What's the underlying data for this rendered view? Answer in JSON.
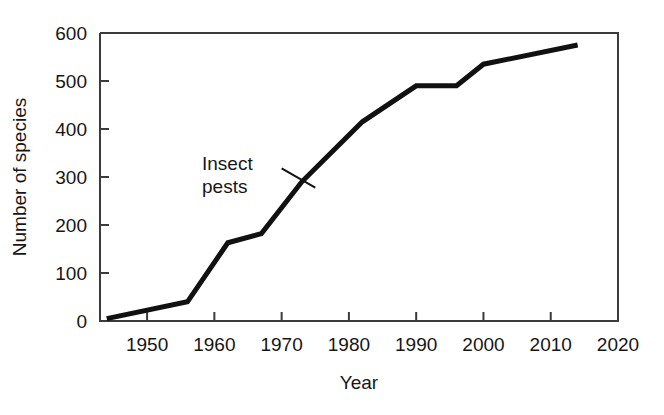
{
  "chart_data": {
    "type": "line",
    "title": "",
    "xlabel": "Year",
    "ylabel": "Number of species",
    "xlim": [
      1943,
      2020
    ],
    "ylim": [
      0,
      600
    ],
    "grid": false,
    "legend": "none",
    "xticks": [
      1950,
      1960,
      1970,
      1980,
      1990,
      2000,
      2010,
      2020
    ],
    "xtick_labels": [
      "1950",
      "1960",
      "1970",
      "1980",
      "1990",
      "2000",
      "2010",
      "2020"
    ],
    "yticks": [
      0,
      100,
      200,
      300,
      400,
      500,
      600
    ],
    "ytick_labels": [
      "0",
      "100",
      "200",
      "300",
      "400",
      "500",
      "600"
    ],
    "series": [
      {
        "name": "Insect pests",
        "color": "#111111",
        "x": [
          1944,
          1956,
          1962,
          1967,
          1973,
          1982,
          1990,
          1996,
          2000,
          2014
        ],
        "values": [
          5,
          40,
          163,
          182,
          290,
          415,
          490,
          490,
          535,
          575
        ]
      }
    ],
    "annotations": [
      {
        "name": "insect-pests-label",
        "lines": [
          "Insect",
          "pests"
        ],
        "x": 1968,
        "y": 350,
        "leader_from": [
          1970,
          318
        ],
        "leader_to": [
          1975,
          278
        ]
      }
    ]
  },
  "axes": {
    "y_axis_title": "Number of species",
    "x_axis_title": "Year"
  }
}
